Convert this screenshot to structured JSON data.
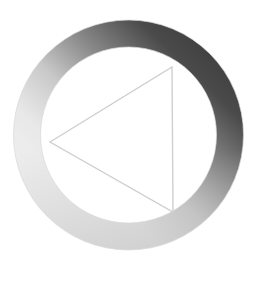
{
  "canvas": {
    "width": 258,
    "height": 288,
    "background_color": "#ffffff",
    "title": "Play Button Logo"
  },
  "graphic": {
    "name": "play-button-logo",
    "description": "Left-pointing triangle outline centered inside a thick gradient-shaded ring",
    "center_x": 128.5,
    "center_y": 135
  },
  "ring": {
    "name": "gradient-ring",
    "outer_radius": 115,
    "inner_radius": 88,
    "thickness": 27,
    "fill_type": "linear-gradient",
    "gradient_angle_deg": 225,
    "gradient_stops": [
      {
        "offset": 0.0,
        "color": "#3a3a3a",
        "label": "darkest-upper-right"
      },
      {
        "offset": 0.18,
        "color": "#4a4a4a",
        "label": "dark-top"
      },
      {
        "offset": 0.38,
        "color": "#8a8a8a",
        "label": "mid-gray"
      },
      {
        "offset": 0.55,
        "color": "#c8c8c8",
        "label": "light-gray"
      },
      {
        "offset": 0.72,
        "color": "#e8e8e8",
        "label": "near-white"
      },
      {
        "offset": 1.0,
        "color": "#f4f4f4",
        "label": "lightest-lower-left"
      }
    ],
    "bottom_tone": "#b8b8b8",
    "edge_color": "#d8d8d8"
  },
  "triangle": {
    "name": "play-triangle",
    "direction": "left",
    "fill": "none",
    "stroke_color": "#cfcfcf",
    "stroke_width": 1.4,
    "vertices": [
      {
        "label": "left-apex",
        "x": 50,
        "y": 142
      },
      {
        "label": "top-right",
        "x": 172,
        "y": 67
      },
      {
        "label": "bottom-right",
        "x": 173,
        "y": 212
      }
    ]
  }
}
